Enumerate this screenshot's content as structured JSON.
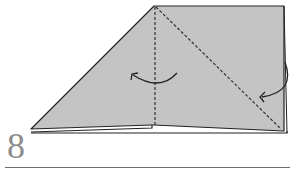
{
  "diagram": {
    "type": "origami-fold-step",
    "step_number": "8",
    "colors": {
      "paper_fill": "#c4c4c4",
      "outline": "#222222",
      "fold_line": "#333333",
      "step_number": "#8c8c8c",
      "rule": "#6e6e6e"
    },
    "annotations": [
      {
        "kind": "valley-fold-line",
        "orientation": "vertical"
      },
      {
        "kind": "valley-fold-line",
        "orientation": "diagonal"
      },
      {
        "kind": "fold-arrow",
        "direction": "left"
      },
      {
        "kind": "fold-arrow",
        "direction": "left-down"
      }
    ]
  }
}
